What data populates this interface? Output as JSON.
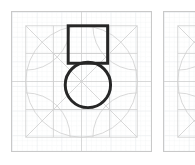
{
  "canvas": {
    "width": 195,
    "height": 165,
    "background": "#ffffff"
  },
  "panels": [
    {
      "name": "glyph-construction-primary",
      "x": 11,
      "y": 11,
      "width": 141,
      "height": 141,
      "border_color": "#c9c9c9",
      "fill": "#ffffff",
      "cropped": false
    },
    {
      "name": "glyph-construction-secondary",
      "x": 163,
      "y": 11,
      "width": 141,
      "height": 141,
      "border_color": "#c9c9c9",
      "fill": "#ffffff",
      "cropped": true
    }
  ],
  "grid": {
    "minor_step": 5,
    "major_step": 25,
    "minor_color": "#eceff1",
    "major_color": "#dfe3e6",
    "minor_width": 0.5,
    "major_width": 0.7,
    "visible": true
  },
  "guides": {
    "color": "#cfcfcf",
    "width": 0.8,
    "margin_square": {
      "x": 14,
      "y": 14,
      "width": 113,
      "height": 113
    },
    "inscribed_circle": {
      "cx": 70.5,
      "cy": 70.5,
      "r": 56.5
    },
    "diagonals": [
      {
        "x1": 14,
        "y1": 14,
        "x2": 127,
        "y2": 127
      },
      {
        "x1": 127,
        "y1": 14,
        "x2": 14,
        "y2": 127
      }
    ],
    "corner_arcs": [
      {
        "cx": 14,
        "cy": 14,
        "r": 45
      },
      {
        "cx": 127,
        "cy": 14,
        "r": 45
      },
      {
        "cx": 14,
        "cy": 127,
        "r": 45
      },
      {
        "cx": 127,
        "cy": 127,
        "r": 45
      }
    ],
    "center_cross": {
      "cx": 70.5,
      "cy": 70.5
    },
    "mid_lines": [
      {
        "x1": 0,
        "y1": 70.5,
        "x2": 141,
        "y2": 70.5
      },
      {
        "x1": 70.5,
        "y1": 0,
        "x2": 70.5,
        "y2": 141
      }
    ],
    "inner_box": {
      "x": 42,
      "y": 42,
      "width": 57,
      "height": 57
    }
  },
  "shapes": {
    "stroke_color": "#262626",
    "stroke_width": 3,
    "fill": "none",
    "square": {
      "label": "square",
      "x": 57,
      "y": 14,
      "width": 40,
      "height": 38
    },
    "circle": {
      "label": "circle",
      "cx": 77,
      "cy": 74,
      "r": 23
    }
  }
}
